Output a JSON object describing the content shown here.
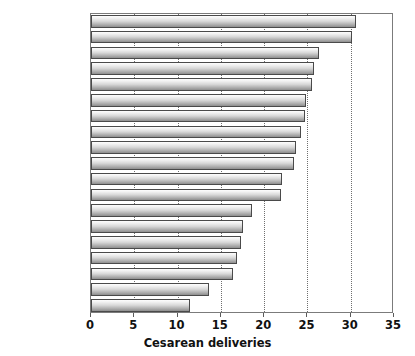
{
  "chart_data": {
    "type": "bar",
    "orientation": "horizontal",
    "title": "",
    "xlabel": "Cesarean deliveries",
    "ylabel": "",
    "xlim": [
      0,
      35
    ],
    "xticks": [
      0,
      5,
      10,
      15,
      20,
      25,
      30,
      35
    ],
    "xtick_labels": [
      "0",
      "5",
      "10",
      "15",
      "20",
      "25",
      "30",
      "35"
    ],
    "grid": "vertical-dotted",
    "legend": "none",
    "categories": [
      "Italy",
      "Greece",
      "Australia",
      "United States",
      "N. Ireland",
      "Wales",
      "Scotland",
      "Germany",
      "Canada",
      "England",
      "Irish Republic",
      "Luxembourg",
      "Austria",
      "France",
      "Belgium",
      "Denmark",
      "Finland",
      "Sweden",
      "Netherlands"
    ],
    "values": [
      30.6,
      30.2,
      26.3,
      25.8,
      25.5,
      24.8,
      24.7,
      24.3,
      23.7,
      23.5,
      22.1,
      21.9,
      18.6,
      17.6,
      17.3,
      16.9,
      16.4,
      13.6,
      11.4
    ]
  },
  "axis": {
    "x_title": "Cesarean deliveries"
  }
}
